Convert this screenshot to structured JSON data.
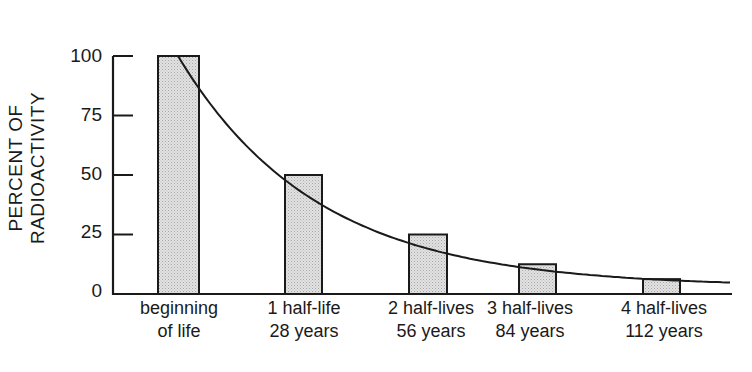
{
  "chart_data": {
    "type": "bar",
    "title": "",
    "xlabel": "",
    "ylabel": "PERCENT OF RADIOACTIVITY",
    "ylim": [
      0,
      100
    ],
    "yticks": [
      0,
      25,
      50,
      75,
      100
    ],
    "grid": false,
    "legend": null,
    "categories": [
      {
        "line1": "beginning",
        "line2": "of life"
      },
      {
        "line1": "1 half-life",
        "line2": "28 years"
      },
      {
        "line1": "2 half-lives",
        "line2": "56 years"
      },
      {
        "line1": "3 half-lives",
        "line2": "84 years"
      },
      {
        "line1": "4 half-lives",
        "line2": "112 years"
      }
    ],
    "values": [
      100,
      50,
      25,
      12.5,
      6.25
    ],
    "overlay": {
      "type": "line",
      "description": "exponential decay curve",
      "shape": "smooth"
    },
    "colors": {
      "bar_fill": "#d9d9d9",
      "stroke": "#1a1a1a",
      "background": "#ffffff"
    }
  },
  "axis": {
    "y_ticks": [
      "0",
      "25",
      "50",
      "75",
      "100"
    ]
  }
}
